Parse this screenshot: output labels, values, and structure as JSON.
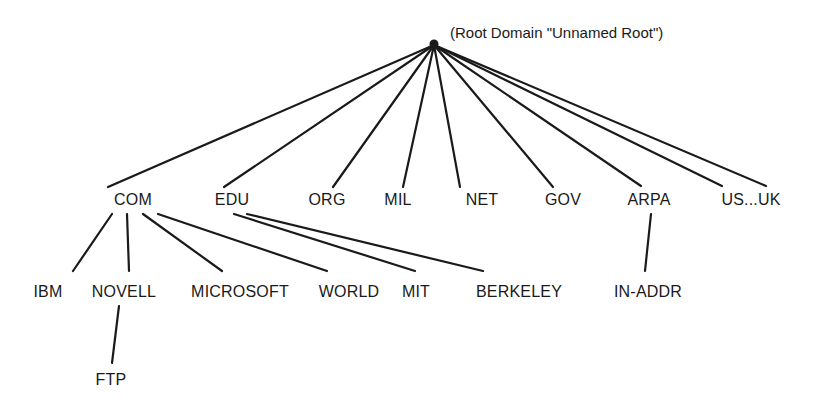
{
  "diagram": {
    "type": "dns-hierarchy-tree",
    "root": {
      "caption": "(Root Domain \"Unnamed Root\")",
      "x": 434,
      "y": 44
    },
    "nodes": [
      {
        "id": "com",
        "label": "COM",
        "x": 133,
        "y": 200
      },
      {
        "id": "edu",
        "label": "EDU",
        "x": 232,
        "y": 200
      },
      {
        "id": "org",
        "label": "ORG",
        "x": 327,
        "y": 200
      },
      {
        "id": "mil",
        "label": "MIL",
        "x": 398,
        "y": 200
      },
      {
        "id": "net",
        "label": "NET",
        "x": 482,
        "y": 200
      },
      {
        "id": "gov",
        "label": "GOV",
        "x": 563,
        "y": 200
      },
      {
        "id": "arpa",
        "label": "ARPA",
        "x": 649,
        "y": 200
      },
      {
        "id": "usuk",
        "label": "US...UK",
        "x": 751,
        "y": 200
      },
      {
        "id": "ibm",
        "label": "IBM",
        "x": 48,
        "y": 292
      },
      {
        "id": "novell",
        "label": "NOVELL",
        "x": 124,
        "y": 292
      },
      {
        "id": "microsoft",
        "label": "MICROSOFT",
        "x": 240,
        "y": 292
      },
      {
        "id": "world",
        "label": "WORLD",
        "x": 349,
        "y": 292
      },
      {
        "id": "mit",
        "label": "MIT",
        "x": 416,
        "y": 292
      },
      {
        "id": "berkeley",
        "label": "BERKELEY",
        "x": 519,
        "y": 292
      },
      {
        "id": "inaddr",
        "label": "IN-ADDR",
        "x": 648,
        "y": 292
      },
      {
        "id": "ftp",
        "label": "FTP",
        "x": 111,
        "y": 380
      }
    ],
    "edges": [
      {
        "from": "root",
        "x1": 434,
        "y1": 45,
        "x2": 108,
        "y2": 187
      },
      {
        "from": "root",
        "x1": 434,
        "y1": 45,
        "x2": 224,
        "y2": 187
      },
      {
        "from": "root",
        "x1": 434,
        "y1": 45,
        "x2": 333,
        "y2": 187
      },
      {
        "from": "root",
        "x1": 434,
        "y1": 45,
        "x2": 403,
        "y2": 187
      },
      {
        "from": "root",
        "x1": 434,
        "y1": 45,
        "x2": 460,
        "y2": 187
      },
      {
        "from": "root",
        "x1": 434,
        "y1": 45,
        "x2": 553,
        "y2": 187
      },
      {
        "from": "root",
        "x1": 434,
        "y1": 45,
        "x2": 641,
        "y2": 186
      },
      {
        "from": "root",
        "x1": 434,
        "y1": 45,
        "x2": 722,
        "y2": 186
      },
      {
        "from": "root",
        "x1": 434,
        "y1": 45,
        "x2": 766,
        "y2": 186
      },
      {
        "from": "com",
        "to": "ibm",
        "x1": 112,
        "y1": 214,
        "x2": 73,
        "y2": 271
      },
      {
        "from": "com",
        "to": "novell",
        "x1": 127,
        "y1": 214,
        "x2": 129,
        "y2": 271
      },
      {
        "from": "com",
        "to": "microsoft",
        "x1": 143,
        "y1": 214,
        "x2": 222,
        "y2": 271
      },
      {
        "from": "com",
        "to": "world",
        "x1": 158,
        "y1": 214,
        "x2": 327,
        "y2": 271
      },
      {
        "from": "edu",
        "to": "mit",
        "x1": 234,
        "y1": 214,
        "x2": 415,
        "y2": 271
      },
      {
        "from": "edu",
        "to": "berkeley",
        "x1": 247,
        "y1": 214,
        "x2": 483,
        "y2": 271
      },
      {
        "from": "arpa",
        "to": "inaddr",
        "x1": 651,
        "y1": 214,
        "x2": 645,
        "y2": 271
      },
      {
        "from": "novell",
        "to": "ftp",
        "x1": 119,
        "y1": 306,
        "x2": 112,
        "y2": 363
      }
    ]
  }
}
